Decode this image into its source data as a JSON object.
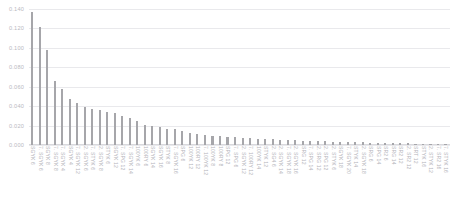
{
  "chart_data": {
    "type": "bar",
    "title": "",
    "xlabel": "",
    "ylabel": "",
    "ylim": [
      0.0,
      0.14
    ],
    "yticks": [
      "0.000",
      "0.020",
      "0.040",
      "0.060",
      "0.080",
      "0.100",
      "0.120",
      "0.140"
    ],
    "ytick_values": [
      0.0,
      0.02,
      0.04,
      0.06,
      0.08,
      0.1,
      0.12,
      0.14
    ],
    "grid": true,
    "legend": false,
    "bar_color": "#a6a6aa",
    "grid_color": "#e9e9ec",
    "categories": [
      "SGYK 6",
      "7. SGYK 6",
      "SGYK 8",
      "7. SGYK 8",
      "7. SGYK 4",
      "SGYK 4",
      "7. SGYK 12",
      "2. SGYK 6",
      "7. STYK 6",
      "2. SGYK 8",
      "STYK 6",
      "SGYK 12",
      "7. SPG 12",
      "7. SGYK 14",
      "100YK 6",
      "100RY 6",
      "SGYK 14",
      "SGYK 16",
      "STYK 8",
      "7. SGYK 16",
      "SPG 6",
      "100YK 12",
      "100RY 12",
      "7. 100YK 12",
      "100YK 8",
      "100RY 8",
      "SPG 12",
      "7. SPG 6",
      "2. SGYK 12",
      "7. 100RY 12",
      "100YK 14",
      "STYK 12",
      "2. SG4 6",
      "2. SGYK 14",
      "7. SGYK 18",
      "2. SGYK 16",
      "SRG 12",
      "7. SPG 14",
      "2. SRG 12",
      "2. SPG 12",
      "2. STYK 6",
      "SGYK 18",
      "7. SGYK 20",
      "STYK 14",
      "2. SGYK 18",
      "SRG 6",
      "SPG 14",
      "SR2 6",
      "SRG 14",
      "SR2 12",
      "2. SR2 12",
      "SRT 12",
      "STYK 16",
      "2. STYK 12",
      "7. SR2 16",
      "7. STYK 16"
    ],
    "values": [
      0.137,
      0.121,
      0.098,
      0.066,
      0.058,
      0.047,
      0.043,
      0.039,
      0.037,
      0.036,
      0.034,
      0.033,
      0.03,
      0.028,
      0.025,
      0.021,
      0.02,
      0.019,
      0.017,
      0.016,
      0.014,
      0.012,
      0.011,
      0.01,
      0.009,
      0.009,
      0.008,
      0.008,
      0.007,
      0.007,
      0.006,
      0.006,
      0.006,
      0.005,
      0.005,
      0.005,
      0.004,
      0.004,
      0.004,
      0.004,
      0.003,
      0.003,
      0.003,
      0.003,
      0.003,
      0.002,
      0.002,
      0.002,
      0.002,
      0.002,
      0.002,
      0.001,
      0.001,
      0.001,
      0.001,
      0.001
    ]
  }
}
